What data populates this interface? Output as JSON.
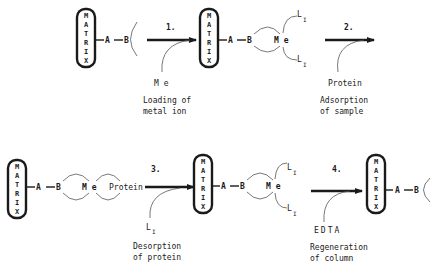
{
  "diagram": {
    "matrix_label": [
      "M",
      "A",
      "T",
      "R",
      "I",
      "X"
    ],
    "atoms": {
      "A": "A",
      "B": "B",
      "Me": "M e",
      "Protein": "Protein",
      "L": "L",
      "I": "I"
    },
    "steps": [
      {
        "number": "1.",
        "reagent": "M e",
        "caption_line1": "Loading of",
        "caption_line2": "metal ion"
      },
      {
        "number": "2.",
        "reagent": "Protein",
        "caption_line1": "Adsorption",
        "caption_line2": "of sample"
      },
      {
        "number": "3.",
        "reagent": "L",
        "reagent_sub": "I",
        "caption_line1": "Desorption",
        "caption_line2": "of protein"
      },
      {
        "number": "4.",
        "reagent": "EDTA",
        "caption_line1": "Regeneration",
        "caption_line2": "of column"
      }
    ]
  }
}
